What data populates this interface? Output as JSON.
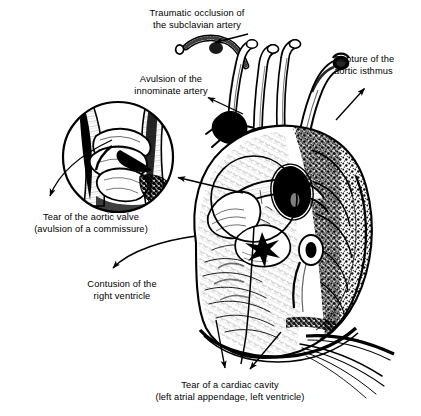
{
  "figure": {
    "style": "black and white pen-and-ink anatomical line engraving",
    "background_color": "#ffffff",
    "ink_color": "#000000"
  },
  "labels": [
    {
      "id": "traumatic-occlusion",
      "text": "Traumatic occlusion of\nthe subclavian artery",
      "x": 121,
      "y": 8,
      "width": 152,
      "align": "center"
    },
    {
      "id": "avulsion-innominate",
      "text": "Avulsion of the\ninnominate artery",
      "x": 104,
      "y": 74,
      "width": 134,
      "align": "center"
    },
    {
      "id": "rupture-isthmus",
      "text": "Rupture of the\naortic isthmus",
      "x": 334,
      "y": 54,
      "width": 86,
      "align": "left"
    },
    {
      "id": "tear-aortic-valve",
      "text": "Tear of the aortic valve\n(avulsion of a commissure)",
      "x": 9,
      "y": 212,
      "width": 164,
      "align": "center"
    },
    {
      "id": "contusion-right-ventricle",
      "text": "Contusion of the\nright ventricle",
      "x": 64,
      "y": 279,
      "width": 116,
      "align": "center"
    },
    {
      "id": "tear-cardiac-cavity",
      "text": "Tear of a cardiac cavity\n(left atrial appendage, left ventricle)",
      "x": 131,
      "y": 380,
      "width": 198,
      "align": "center"
    }
  ],
  "leaders": [
    {
      "id": "leader-subclavian",
      "type": "straight-arrow",
      "from": [
        248,
        34
      ],
      "to": [
        213,
        43
      ]
    },
    {
      "id": "leader-innominate",
      "type": "straight-arrow",
      "from": [
        243,
        114
      ],
      "to": [
        206,
        97
      ]
    },
    {
      "id": "leader-isthmus",
      "type": "straight-arrow",
      "from": [
        336,
        120
      ],
      "to": [
        366,
        87
      ]
    },
    {
      "id": "leader-inset-callout",
      "type": "straight-arrow",
      "from": [
        243,
        193
      ],
      "to": [
        176,
        177
      ]
    },
    {
      "id": "leader-aortic-valve",
      "type": "curved-arrow",
      "from": [
        110,
        140
      ],
      "to": [
        48,
        205
      ]
    },
    {
      "id": "leader-right-ventricle",
      "type": "curved-arrow",
      "from": [
        196,
        236
      ],
      "to": [
        110,
        273
      ]
    },
    {
      "id": "leader-cavity-left",
      "type": "straight-arrow",
      "from": [
        216,
        320
      ],
      "to": [
        226,
        371
      ]
    },
    {
      "id": "leader-cavity-right",
      "type": "straight-arrow",
      "from": [
        281,
        332
      ],
      "to": [
        248,
        372
      ]
    }
  ],
  "anatomy": {
    "inset": {
      "id": "aortic-valve-inset",
      "name": "magnified aortic valve with avulsed commissure",
      "center": [
        118,
        157
      ],
      "radius": 55
    },
    "heart_overlay_circle": {
      "id": "aortic-root-circle",
      "name": "circle marking the aortic root region on the heart",
      "center": [
        254,
        199
      ],
      "radius": 43
    },
    "structures": [
      {
        "id": "subclavian-artery",
        "label": "left subclavian artery stump"
      },
      {
        "id": "innominate-artery",
        "label": "innominate (brachiocephalic) artery"
      },
      {
        "id": "left-common-carotid",
        "label": "left common carotid artery"
      },
      {
        "id": "aortic-arch",
        "label": "aortic arch"
      },
      {
        "id": "aortic-isthmus",
        "label": "aortic isthmus"
      },
      {
        "id": "superior-vena-cava",
        "label": "superior vena cava"
      },
      {
        "id": "pulmonary-trunk",
        "label": "pulmonary trunk"
      },
      {
        "id": "right-atrium",
        "label": "right atrium"
      },
      {
        "id": "left-atrial-appendage",
        "label": "left atrial appendage"
      },
      {
        "id": "right-ventricle",
        "label": "right ventricle"
      },
      {
        "id": "left-ventricle",
        "label": "left ventricle"
      },
      {
        "id": "coronary-vessels",
        "label": "coronary arteries and veins"
      },
      {
        "id": "pericardial-reflection",
        "label": "pericardial reflection at the base"
      }
    ]
  }
}
